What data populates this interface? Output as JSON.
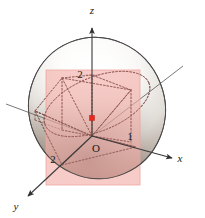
{
  "figure": {
    "background_color": "#ffffff",
    "axes": [
      {
        "name": "x",
        "label": "x",
        "direction": "right-down",
        "label_x": 180,
        "label_y": 162
      },
      {
        "name": "y",
        "label": "y",
        "direction": "left-down",
        "label_x": 16,
        "label_y": 210
      },
      {
        "name": "z",
        "label": "z",
        "direction": "up",
        "label_x": 92,
        "label_y": 14
      }
    ],
    "tick_labels": [
      {
        "name": "z-axis-tick",
        "text": "2",
        "x": 80,
        "y": 78,
        "axis": "z",
        "value": 2
      },
      {
        "name": "y-axis-tick",
        "text": "2",
        "x": 53,
        "y": 163,
        "axis": "y",
        "value": 2
      },
      {
        "name": "x-axis-tick",
        "text": "1",
        "x": 130,
        "y": 140,
        "axis": "x",
        "value": 1
      }
    ],
    "origin": {
      "name": "origin",
      "label": "O",
      "x": 96,
      "y": 146,
      "point_x": 92,
      "point_y": 136
    },
    "marked_point": {
      "name": "highlighted-point",
      "color": "#e8281e",
      "x": 92,
      "y": 118,
      "size": 5
    },
    "plane": {
      "name": "cutting-plane",
      "fill_color": "#f5b6b0",
      "stroke_color": "#e9a49e",
      "opacity": 0.72,
      "x": 46,
      "y": 70,
      "width": 94,
      "height": 115
    },
    "surface": {
      "name": "ellipsoid-surface",
      "highlight_color": "#ffffff",
      "mid_color": "#e6e3de",
      "shadow_color": "#6d5f57",
      "outline_color": "#3c3c3c",
      "cx": 97,
      "cy": 108,
      "rx": 68,
      "ry": 71,
      "rotation": -22
    },
    "construction": {
      "name": "dashed-construction-lines",
      "color": "#7a4a46",
      "dash": "1.6 1.9",
      "width": 0.8
    }
  }
}
